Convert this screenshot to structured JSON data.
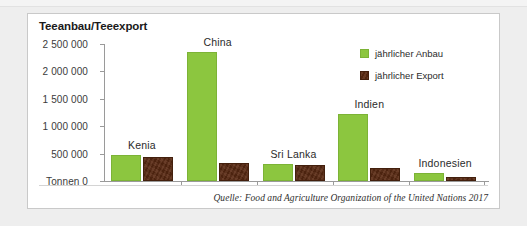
{
  "card": {
    "title": "Teeanbau/Teeexport",
    "source_note": "Quelle: Food and Agriculture Organization of the United Nations 2017"
  },
  "legend": {
    "items": [
      {
        "label": "jährlicher Anbau",
        "color": "#8cc63f",
        "key": "anbau"
      },
      {
        "label": "jährlicher Export",
        "color": "#5a2a12",
        "key": "export"
      }
    ]
  },
  "axis": {
    "unit_label": "Tonnen",
    "zero_label": "0",
    "tick_labels": [
      "2 500 000",
      "2 000 000",
      "1 500 000",
      "1 000 000",
      "500 000",
      "Tonnen 0"
    ]
  },
  "chart_data": {
    "type": "bar",
    "title": "Teeanbau/Teeexport",
    "xlabel": "",
    "ylabel": "Tonnen",
    "ylim": [
      0,
      2500000
    ],
    "yticks": [
      0,
      500000,
      1000000,
      1500000,
      2000000,
      2500000
    ],
    "ytick_labels": [
      "0",
      "500 000",
      "1 000 000",
      "1 500 000",
      "2 000 000",
      "2 500 000"
    ],
    "grid": false,
    "legend_position": "top-right",
    "categories": [
      "Kenia",
      "China",
      "Sri Lanka",
      "Indien",
      "Indonesien"
    ],
    "series": [
      {
        "name": "jährlicher Anbau",
        "color": "#8cc63f",
        "values": [
          473000,
          2350000,
          310000,
          1220000,
          145000
        ]
      },
      {
        "name": "jährlicher Export",
        "color": "#5a2a12",
        "values": [
          440000,
          330000,
          290000,
          230000,
          70000
        ]
      }
    ],
    "annotations": [
      "Quelle: Food and Agriculture Organization of the United Nations 2017"
    ]
  }
}
